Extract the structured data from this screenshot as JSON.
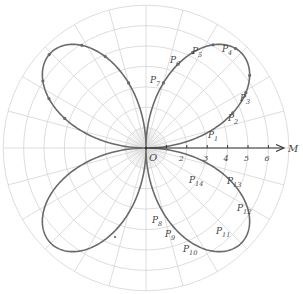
{
  "diagram": {
    "type": "polar-rose",
    "center": {
      "x": 146,
      "y": 148
    },
    "unit_px": 20.4,
    "rings": 7,
    "radial_step_deg": 15,
    "rose_amplitude": 6.6,
    "colors": {
      "grid": "#d4d4d4",
      "curve": "#6a6a6a",
      "axis": "#333333",
      "label": "#555555",
      "point": "#6a6a6a"
    },
    "axis": {
      "label": "M",
      "ticks": [
        {
          "value": 1,
          "label": ""
        },
        {
          "value": 2,
          "label": "2"
        },
        {
          "value": 3,
          "label": "3"
        },
        {
          "value": 4,
          "label": "4"
        },
        {
          "value": 5,
          "label": "5"
        },
        {
          "value": 6,
          "label": "6"
        }
      ]
    },
    "origin_label": "O",
    "points": [
      {
        "name": "P",
        "sub": "1",
        "theta": 22
      },
      {
        "name": "P",
        "sub": "2",
        "theta": 29
      },
      {
        "name": "P",
        "sub": "3",
        "theta": 35
      },
      {
        "name": "P",
        "sub": "4",
        "theta": 48
      },
      {
        "name": "P",
        "sub": "5",
        "theta": 57
      },
      {
        "name": "P",
        "sub": "6",
        "theta": 64
      },
      {
        "name": "P",
        "sub": "7",
        "theta": 75
      },
      {
        "name": "P",
        "sub": "8",
        "theta": -75
      },
      {
        "name": "P",
        "sub": "9",
        "theta": -66
      },
      {
        "name": "P",
        "sub": "10",
        "theta": -58
      },
      {
        "name": "P",
        "sub": "11",
        "theta": -44
      },
      {
        "name": "P",
        "sub": "12",
        "theta": -33
      },
      {
        "name": "P",
        "sub": "13",
        "theta": -27
      },
      {
        "name": "P",
        "sub": "14",
        "theta": -20
      }
    ],
    "labels": [
      {
        "sub": "1",
        "x": 208,
        "y": 138
      },
      {
        "sub": "2",
        "x": 228,
        "y": 121
      },
      {
        "sub": "3",
        "x": 240,
        "y": 101
      },
      {
        "sub": "4",
        "x": 222,
        "y": 52
      },
      {
        "sub": "5",
        "x": 192,
        "y": 54
      },
      {
        "sub": "6",
        "x": 170,
        "y": 63
      },
      {
        "sub": "7",
        "x": 150,
        "y": 83
      },
      {
        "sub": "8",
        "x": 152,
        "y": 223
      },
      {
        "sub": "9",
        "x": 165,
        "y": 237
      },
      {
        "sub": "10",
        "x": 183,
        "y": 252
      },
      {
        "sub": "11",
        "x": 216,
        "y": 234
      },
      {
        "sub": "12",
        "x": 237,
        "y": 211
      },
      {
        "sub": "13",
        "x": 227,
        "y": 184
      },
      {
        "sub": "14",
        "x": 189,
        "y": 183
      }
    ],
    "stray_dot": {
      "x": 115,
      "y": 237
    }
  }
}
